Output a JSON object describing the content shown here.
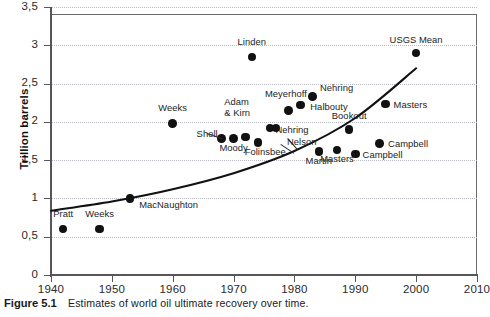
{
  "figure": {
    "caption_label": "Figure 5.1",
    "caption_text": "Estimates of world oil ultimate recovery over time."
  },
  "chart_data": {
    "type": "scatter",
    "title": "",
    "xlabel": "",
    "ylabel": "Trillion barrels",
    "xlim": [
      1940,
      2010
    ],
    "ylim": [
      0,
      3.5
    ],
    "xticks": [
      "1940",
      "1950",
      "1960",
      "1970",
      "1980",
      "1990",
      "2000",
      "2010"
    ],
    "yticks": [
      "0",
      "0,5",
      "1",
      "1,5",
      "2",
      "2,5",
      "3",
      "3,5"
    ],
    "grid": "horizontal-dotted",
    "legend": "none",
    "decimal_separator": ",",
    "points": [
      {
        "label": "Pratt",
        "x": 1942,
        "y": 0.6,
        "lx": 1942,
        "ly": 0.78,
        "align": "ctr"
      },
      {
        "label": "Weeks",
        "x": 1948,
        "y": 0.6,
        "lx": 1948,
        "ly": 0.78,
        "align": "ctr"
      },
      {
        "label": "MacNaughton",
        "x": 1953,
        "y": 1.0,
        "lx": 1954.5,
        "ly": 0.9,
        "align": "left"
      },
      {
        "label": "Weeks",
        "x": 1960,
        "y": 1.98,
        "lx": 1960,
        "ly": 2.17,
        "align": "ctr"
      },
      {
        "label": "Shell",
        "x": 1968,
        "y": 1.78,
        "lx": 1967.4,
        "ly": 1.83,
        "align": "rt"
      },
      {
        "label": "Moody",
        "x": 1970,
        "y": 1.78,
        "lx": 1970,
        "ly": 1.64,
        "align": "ctr"
      },
      {
        "label": "Adam & Kirn",
        "x": 1972,
        "y": 1.8,
        "lx": 1970.6,
        "ly": 2.18,
        "align": "ctr"
      },
      {
        "label": "Linden",
        "x": 1973,
        "y": 2.85,
        "lx": 1973,
        "ly": 3.03,
        "align": "ctr"
      },
      {
        "label": "Folinsbee",
        "x": 1974,
        "y": 1.73,
        "lx": 1975.2,
        "ly": 1.6,
        "align": "ctr"
      },
      {
        "label": "Nehring",
        "x": 1976,
        "y": 1.92,
        "lx": 1979.6,
        "ly": 1.88,
        "align": "ctr"
      },
      {
        "label": "Nelson",
        "x": 1977,
        "y": 1.92,
        "lx": 1981.2,
        "ly": 1.72,
        "align": "ctr"
      },
      {
        "label": "Meyerhoff",
        "x": 1979,
        "y": 2.15,
        "lx": 1978.6,
        "ly": 2.35,
        "align": "ctr"
      },
      {
        "label": "Halbouty",
        "x": 1981,
        "y": 2.22,
        "lx": 1982.6,
        "ly": 2.18,
        "align": "left"
      },
      {
        "label": "Nehring",
        "x": 1983,
        "y": 2.33,
        "lx": 1984.2,
        "ly": 2.43,
        "align": "left"
      },
      {
        "label": "Martin",
        "x": 1984,
        "y": 1.61,
        "lx": 1984,
        "ly": 1.48,
        "align": "ctr"
      },
      {
        "label": "Masters",
        "x": 1987,
        "y": 1.63,
        "lx": 1987,
        "ly": 1.5,
        "align": "ctr"
      },
      {
        "label": "Bookout",
        "x": 1989,
        "y": 1.9,
        "lx": 1989,
        "ly": 2.06,
        "align": "ctr"
      },
      {
        "label": "Campbell",
        "x": 1990,
        "y": 1.58,
        "lx": 1991.2,
        "ly": 1.55,
        "align": "left"
      },
      {
        "label": "Campbell",
        "x": 1994,
        "y": 1.72,
        "lx": 1995.4,
        "ly": 1.7,
        "align": "left"
      },
      {
        "label": "Masters",
        "x": 1995,
        "y": 2.23,
        "lx": 1996.3,
        "ly": 2.21,
        "align": "left"
      },
      {
        "label": "USGS Mean",
        "x": 2000,
        "y": 2.9,
        "lx": 2000,
        "ly": 3.06,
        "align": "ctr"
      }
    ],
    "trend_curve": {
      "description": "fitted rising trend line",
      "points": [
        {
          "x": 1940,
          "y": 0.84
        },
        {
          "x": 1950,
          "y": 0.96
        },
        {
          "x": 1960,
          "y": 1.12
        },
        {
          "x": 1970,
          "y": 1.33
        },
        {
          "x": 1980,
          "y": 1.62
        },
        {
          "x": 1990,
          "y": 2.05
        },
        {
          "x": 2000,
          "y": 2.7
        }
      ]
    },
    "colors": {
      "point": "#111111",
      "curve": "#111111",
      "grid": "#b9b9c4",
      "axis": "#55555a",
      "frame": "#6b6b6d",
      "background": "#ffffff"
    }
  }
}
